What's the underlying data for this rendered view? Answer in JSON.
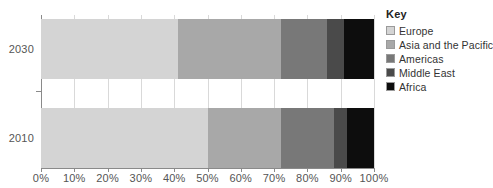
{
  "chart_data": {
    "type": "bar",
    "orientation": "horizontal",
    "stacked": true,
    "stack_mode": "percent",
    "title": "",
    "subtitle": "",
    "xlabel": "",
    "ylabel": "",
    "categories": [
      "2030",
      "2010"
    ],
    "xlim": [
      0,
      100
    ],
    "xticks": [
      0,
      10,
      20,
      30,
      40,
      50,
      60,
      70,
      80,
      90,
      100
    ],
    "xtick_labels": [
      "0%",
      "10%",
      "20%",
      "30%",
      "40%",
      "50%",
      "60%",
      "70%",
      "80%",
      "90%",
      "100%"
    ],
    "grid": true,
    "grid_axis": "x",
    "legend_position": "right",
    "legend_title": "Key",
    "series": [
      {
        "name": "Europe",
        "color": "#d4d4d4",
        "values": [
          41,
          50
        ]
      },
      {
        "name": "Asia and the Pacific",
        "color": "#a8a8a8",
        "values": [
          31,
          22
        ]
      },
      {
        "name": "Americas",
        "color": "#787878",
        "values": [
          14,
          16
        ]
      },
      {
        "name": "Middle East",
        "color": "#4a4a4a",
        "values": [
          5,
          4
        ]
      },
      {
        "name": "Africa",
        "color": "#0d0d0d",
        "values": [
          9,
          8
        ]
      }
    ],
    "cumulative_boundaries": {
      "2030": [
        41,
        72,
        86,
        91,
        100
      ],
      "2010": [
        50,
        72,
        88,
        92,
        100
      ]
    }
  },
  "legend": {
    "title": "Key",
    "items": [
      {
        "label": "Europe",
        "color": "#d4d4d4"
      },
      {
        "label": "Asia and the Pacific",
        "color": "#a8a8a8"
      },
      {
        "label": "Americas",
        "color": "#787878"
      },
      {
        "label": "Middle East",
        "color": "#4a4a4a"
      },
      {
        "label": "Africa",
        "color": "#0d0d0d"
      }
    ]
  },
  "axis": {
    "category_labels": [
      "2030",
      "2010"
    ],
    "tick_labels": [
      "0%",
      "10%",
      "20%",
      "30%",
      "40%",
      "50%",
      "60%",
      "70%",
      "80%",
      "90%",
      "100%"
    ]
  },
  "colors": {
    "grid": "#d9d9d9",
    "axis": "#8a8a8a",
    "label_text": "#555555",
    "legend_text": "#333333",
    "background": "#ffffff"
  }
}
